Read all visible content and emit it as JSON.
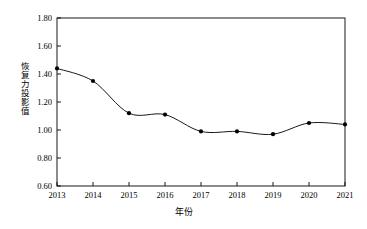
{
  "chart_data": {
    "type": "line",
    "title": "",
    "xlabel": "年份",
    "ylabel": "恢复力投影值",
    "categories": [
      2013,
      2014,
      2015,
      2016,
      2017,
      2018,
      2019,
      2020,
      2021
    ],
    "x_tick_labels": [
      "2013",
      "2014",
      "2015",
      "2016",
      "2017",
      "2018",
      "2019",
      "2020",
      "2021"
    ],
    "y_tick_labels": [
      "0.60",
      "0.80",
      "1.00",
      "1.20",
      "1.40",
      "1.60",
      "1.80"
    ],
    "y_ticks": [
      0.6,
      0.8,
      1.0,
      1.2,
      1.4,
      1.6,
      1.8
    ],
    "values": [
      1.44,
      1.35,
      1.12,
      1.11,
      0.99,
      0.99,
      0.97,
      1.05,
      1.04
    ],
    "xlim": [
      2013,
      2021
    ],
    "ylim": [
      0.6,
      1.8
    ],
    "grid": false,
    "legend": "none",
    "series": [
      {
        "name": "恢复力投影值",
        "values": [
          1.44,
          1.35,
          1.12,
          1.11,
          0.99,
          0.99,
          0.97,
          1.05,
          1.04
        ]
      }
    ],
    "marker": "filled-circle",
    "line_color": "#000000",
    "marker_color": "#000000",
    "smoothing": "spline"
  }
}
